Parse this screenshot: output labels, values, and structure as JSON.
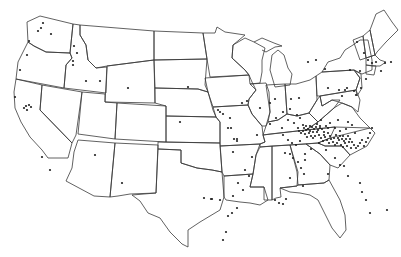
{
  "map": {
    "type": "US state outline dot map",
    "background": "#ffffff",
    "line_color": "#3a3a3a",
    "dot_color": "#222222",
    "dot_radius": 1.1,
    "dots": [
      [
        43,
        23
      ],
      [
        41,
        28
      ],
      [
        38,
        31
      ],
      [
        51,
        34
      ],
      [
        29,
        41
      ],
      [
        27,
        55
      ],
      [
        20,
        70
      ],
      [
        15,
        97
      ],
      [
        26,
        106
      ],
      [
        29,
        105
      ],
      [
        27,
        110
      ],
      [
        24,
        108
      ],
      [
        31,
        107
      ],
      [
        74,
        46
      ],
      [
        77,
        53
      ],
      [
        73,
        61
      ],
      [
        73,
        65
      ],
      [
        86,
        81
      ],
      [
        100,
        81
      ],
      [
        42,
        157
      ],
      [
        50,
        170
      ],
      [
        95,
        155
      ],
      [
        122,
        183
      ],
      [
        188,
        87
      ],
      [
        218,
        110
      ],
      [
        220,
        112
      ],
      [
        223,
        114
      ],
      [
        228,
        128
      ],
      [
        231,
        128
      ],
      [
        234,
        139
      ],
      [
        237,
        139
      ],
      [
        237,
        141
      ],
      [
        233,
        152
      ],
      [
        204,
        198
      ],
      [
        212,
        199
      ],
      [
        180,
        122
      ],
      [
        128,
        88
      ],
      [
        247,
        101
      ],
      [
        242,
        103
      ],
      [
        260,
        108
      ],
      [
        230,
        118
      ],
      [
        257,
        135
      ],
      [
        270,
        103
      ],
      [
        275,
        99
      ],
      [
        291,
        99
      ],
      [
        290,
        109
      ],
      [
        299,
        98
      ],
      [
        308,
        62
      ],
      [
        316,
        60
      ],
      [
        325,
        69
      ],
      [
        328,
        88
      ],
      [
        339,
        90
      ],
      [
        345,
        90
      ],
      [
        347,
        88
      ],
      [
        342,
        96
      ],
      [
        354,
        91
      ],
      [
        356,
        95
      ],
      [
        361,
        88
      ],
      [
        357,
        42
      ],
      [
        364,
        53
      ],
      [
        368,
        60
      ],
      [
        372,
        63
      ],
      [
        376,
        62
      ],
      [
        381,
        71
      ],
      [
        385,
        63
      ],
      [
        391,
        62
      ],
      [
        360,
        71
      ],
      [
        366,
        79
      ],
      [
        350,
        70
      ],
      [
        270,
        124
      ],
      [
        276,
        118
      ],
      [
        283,
        112
      ],
      [
        288,
        120
      ],
      [
        294,
        123
      ],
      [
        297,
        115
      ],
      [
        300,
        118
      ],
      [
        303,
        125
      ],
      [
        306,
        130
      ],
      [
        310,
        126
      ],
      [
        313,
        132
      ],
      [
        317,
        124
      ],
      [
        320,
        128
      ],
      [
        321,
        120
      ],
      [
        324,
        135
      ],
      [
        328,
        128
      ],
      [
        330,
        123
      ],
      [
        335,
        128
      ],
      [
        338,
        120
      ],
      [
        340,
        131
      ],
      [
        343,
        136
      ],
      [
        346,
        129
      ],
      [
        348,
        122
      ],
      [
        352,
        125
      ],
      [
        355,
        133
      ],
      [
        298,
        128
      ],
      [
        299,
        131
      ],
      [
        301,
        133
      ],
      [
        303,
        131
      ],
      [
        305,
        134
      ],
      [
        307,
        137
      ],
      [
        309,
        133
      ],
      [
        311,
        136
      ],
      [
        313,
        138
      ],
      [
        315,
        136
      ],
      [
        317,
        132
      ],
      [
        319,
        135
      ],
      [
        321,
        138
      ],
      [
        323,
        141
      ],
      [
        325,
        137
      ],
      [
        327,
        140
      ],
      [
        329,
        143
      ],
      [
        331,
        139
      ],
      [
        333,
        142
      ],
      [
        335,
        145
      ],
      [
        337,
        143
      ],
      [
        339,
        140
      ],
      [
        341,
        145
      ],
      [
        343,
        147
      ],
      [
        345,
        143
      ],
      [
        347,
        146
      ],
      [
        349,
        142
      ],
      [
        351,
        148
      ],
      [
        304,
        128
      ],
      [
        306,
        126
      ],
      [
        308,
        129
      ],
      [
        310,
        131
      ],
      [
        312,
        127
      ],
      [
        314,
        129
      ],
      [
        316,
        127
      ],
      [
        318,
        130
      ],
      [
        320,
        126
      ],
      [
        322,
        129
      ],
      [
        324,
        132
      ],
      [
        326,
        126
      ],
      [
        328,
        133
      ],
      [
        330,
        136
      ],
      [
        334,
        138
      ],
      [
        336,
        135
      ],
      [
        338,
        138
      ],
      [
        340,
        136
      ],
      [
        342,
        139
      ],
      [
        344,
        141
      ],
      [
        346,
        139
      ],
      [
        348,
        136
      ],
      [
        350,
        139
      ],
      [
        352,
        142
      ],
      [
        354,
        145
      ],
      [
        356,
        148
      ],
      [
        358,
        146
      ],
      [
        360,
        143
      ],
      [
        362,
        140
      ],
      [
        364,
        146
      ],
      [
        366,
        142
      ],
      [
        368,
        138
      ],
      [
        370,
        133
      ],
      [
        372,
        128
      ],
      [
        282,
        128
      ],
      [
        283,
        135
      ],
      [
        288,
        140
      ],
      [
        292,
        143
      ],
      [
        296,
        145
      ],
      [
        300,
        141
      ],
      [
        285,
        153
      ],
      [
        290,
        154
      ],
      [
        293,
        158
      ],
      [
        298,
        162
      ],
      [
        305,
        154
      ],
      [
        311,
        149
      ],
      [
        319,
        143
      ],
      [
        326,
        150
      ],
      [
        335,
        158
      ],
      [
        340,
        165
      ],
      [
        344,
        166
      ],
      [
        348,
        176
      ],
      [
        328,
        174
      ],
      [
        305,
        160
      ],
      [
        301,
        168
      ],
      [
        304,
        174
      ],
      [
        290,
        178
      ],
      [
        303,
        186
      ],
      [
        360,
        183
      ],
      [
        362,
        192
      ],
      [
        366,
        200
      ],
      [
        370,
        213
      ],
      [
        387,
        210
      ],
      [
        275,
        200
      ],
      [
        279,
        203
      ],
      [
        283,
        204
      ],
      [
        286,
        199
      ],
      [
        252,
        157
      ],
      [
        245,
        170
      ],
      [
        249,
        176
      ],
      [
        238,
        183
      ],
      [
        233,
        196
      ],
      [
        220,
        200
      ],
      [
        211,
        199
      ],
      [
        243,
        190
      ],
      [
        237,
        208
      ],
      [
        232,
        213
      ],
      [
        228,
        216
      ],
      [
        223,
        240
      ],
      [
        226,
        232
      ]
    ]
  }
}
